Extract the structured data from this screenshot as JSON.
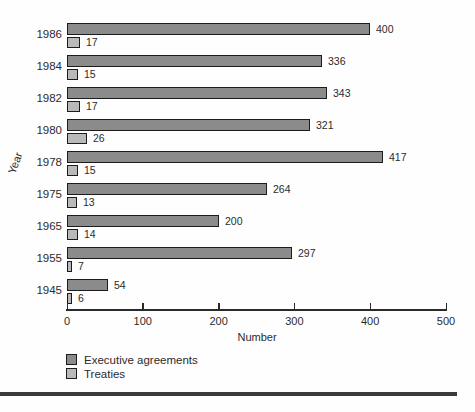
{
  "chart_data": {
    "type": "bar",
    "orientation": "horizontal",
    "title": "",
    "xlabel": "Number",
    "ylabel": "Year",
    "xlim": [
      0,
      500
    ],
    "xticks": [
      0,
      100,
      200,
      300,
      400,
      500
    ],
    "grid": false,
    "legend_position": "bottom-left",
    "categories": [
      "1986",
      "1984",
      "1982",
      "1980",
      "1978",
      "1975",
      "1965",
      "1955",
      "1945"
    ],
    "series": [
      {
        "name": "Executive agreements",
        "color": "#8b8b8b",
        "values": [
          400,
          336,
          343,
          321,
          417,
          264,
          200,
          297,
          54
        ]
      },
      {
        "name": "Treaties",
        "color": "#b9b9b9",
        "values": [
          17,
          15,
          17,
          26,
          15,
          13,
          14,
          7,
          6
        ]
      }
    ],
    "rows": [
      {
        "year": "1986",
        "exec": 400,
        "treaties": 17
      },
      {
        "year": "1984",
        "exec": 336,
        "treaties": 15
      },
      {
        "year": "1982",
        "exec": 343,
        "treaties": 17
      },
      {
        "year": "1980",
        "exec": 321,
        "treaties": 26
      },
      {
        "year": "1978",
        "exec": 417,
        "treaties": 15
      },
      {
        "year": "1975",
        "exec": 264,
        "treaties": 13
      },
      {
        "year": "1965",
        "exec": 200,
        "treaties": 14
      },
      {
        "year": "1955",
        "exec": 297,
        "treaties": 7
      },
      {
        "year": "1945",
        "exec": 54,
        "treaties": 6
      }
    ],
    "legend": [
      {
        "label": "Executive agreements",
        "color": "#8b8b8b"
      },
      {
        "label": "Treaties",
        "color": "#b9b9b9"
      }
    ]
  }
}
